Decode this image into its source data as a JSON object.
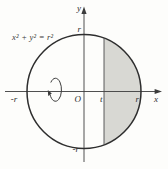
{
  "figure": {
    "equation": "x² + y² = r²",
    "axis_labels": {
      "x": "x",
      "y": "y"
    },
    "origin_label": "O",
    "ticks": {
      "y_top": "r",
      "y_bottom": "-r",
      "x_left": "-r",
      "x_right": "r",
      "t": "t"
    },
    "colors": {
      "shade": "#d8d8d3",
      "curve": "#2e2e2e",
      "axis": "#3c3c3c"
    }
  }
}
